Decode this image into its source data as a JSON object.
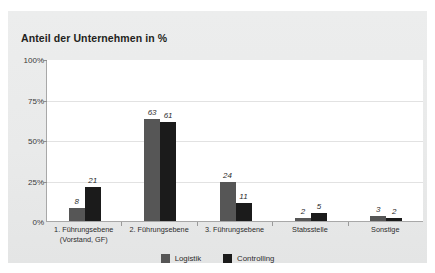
{
  "card": {
    "background_color": "#eaebeb"
  },
  "chart_data": {
    "type": "bar",
    "title": "Anteil der Unternehmen in %",
    "xlabel": "",
    "ylabel": "",
    "ylim": [
      0,
      100
    ],
    "grid": true,
    "legend_position": "bottom",
    "categories": [
      "1. Führungsebene (Vorstand, GF)",
      "2. Führungsebene",
      "3. Führungsebene",
      "Stabsstelle",
      "Sonstige"
    ],
    "category_lines": [
      [
        "1. Führungsebene",
        "(Vorstand, GF)"
      ],
      [
        "2. Führungsebene"
      ],
      [
        "3. Führungsebene"
      ],
      [
        "Stabsstelle"
      ],
      [
        "Sonstige"
      ]
    ],
    "ytick_labels": [
      "100%",
      "75%",
      "50%",
      "25%",
      "0%"
    ],
    "ytick_values": [
      100,
      75,
      50,
      25,
      0
    ],
    "series": [
      {
        "name": "Logistik",
        "color": "#565656",
        "values": [
          8,
          63,
          24,
          2,
          3
        ]
      },
      {
        "name": "Controlling",
        "color": "#1b1b1b",
        "values": [
          21,
          61,
          11,
          5,
          2
        ]
      }
    ]
  }
}
